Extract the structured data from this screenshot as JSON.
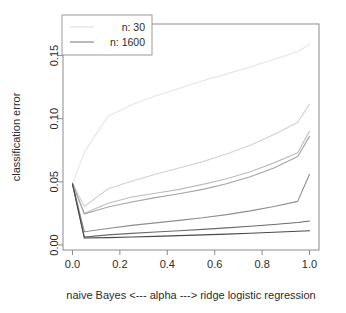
{
  "chart_data": {
    "type": "line",
    "title": "",
    "subtitle": "",
    "xlabel": "naive Bayes  <---  alpha  --->  ridge logistic regression",
    "ylabel": "classification error",
    "xlim": [
      -0.04,
      1.04
    ],
    "ylim": [
      -0.004,
      0.175
    ],
    "xticks": [
      0.0,
      0.2,
      0.4,
      0.6,
      0.8,
      1.0
    ],
    "xtick_labels": [
      "0.0",
      "0.2",
      "0.4",
      "0.6",
      "0.8",
      "1.0"
    ],
    "yticks": [
      0.0,
      0.05,
      0.1,
      0.15
    ],
    "ytick_labels": [
      "0.00",
      "0.05",
      "0.10",
      "0.15"
    ],
    "grid": false,
    "legend_position": "top-left",
    "legend_entries": [
      {
        "label": "n: 30",
        "color": "#e2e2e2"
      },
      {
        "label": "n: 1600",
        "color": "#8a8a8a"
      }
    ],
    "x": [
      0.0,
      0.05,
      0.15,
      0.25,
      0.35,
      0.45,
      0.55,
      0.65,
      0.75,
      0.85,
      0.95,
      1.0
    ],
    "series": [
      {
        "name": "n: 30",
        "color": "#e6e6e6",
        "values": [
          0.048,
          0.0735,
          0.102,
          0.111,
          0.118,
          0.124,
          0.13,
          0.1355,
          0.141,
          0.147,
          0.153,
          0.159
        ]
      },
      {
        "name": "n: 60",
        "color": "#d2d2d2",
        "values": [
          0.049,
          0.0305,
          0.0445,
          0.0505,
          0.056,
          0.061,
          0.066,
          0.072,
          0.079,
          0.0875,
          0.097,
          0.1115
        ]
      },
      {
        "name": "n: 120",
        "color": "#bcbcbc",
        "values": [
          0.0488,
          0.025,
          0.033,
          0.038,
          0.041,
          0.044,
          0.048,
          0.0525,
          0.058,
          0.065,
          0.073,
          0.09
        ]
      },
      {
        "name": "n: 240",
        "color": "#a4a4a4",
        "values": [
          0.0487,
          0.0245,
          0.03,
          0.034,
          0.0375,
          0.0405,
          0.044,
          0.0485,
          0.054,
          0.061,
          0.07,
          0.086
        ]
      },
      {
        "name": "n: 480",
        "color": "#8e8e8e",
        "values": [
          0.0486,
          0.0105,
          0.013,
          0.0155,
          0.0175,
          0.0195,
          0.0215,
          0.024,
          0.027,
          0.0305,
          0.0345,
          0.056
        ]
      },
      {
        "name": "n: 960",
        "color": "#6a6a6a",
        "values": [
          0.0484,
          0.0062,
          0.008,
          0.0092,
          0.0103,
          0.0113,
          0.0123,
          0.0135,
          0.0148,
          0.0162,
          0.0178,
          0.019
        ]
      },
      {
        "name": "n: 1600",
        "color": "#4a4a4a",
        "values": [
          0.0482,
          0.0055,
          0.0058,
          0.0063,
          0.0068,
          0.0074,
          0.008,
          0.0086,
          0.0093,
          0.01,
          0.0108,
          0.0112
        ]
      }
    ]
  },
  "axes": {
    "y_title": "classification error",
    "x_title": "naive Bayes  <---  alpha  --->  ridge logistic regression",
    "y_tick_0": "0.00",
    "y_tick_1": "0.05",
    "y_tick_2": "0.10",
    "y_tick_3": "0.15",
    "x_tick_0": "0.0",
    "x_tick_1": "0.2",
    "x_tick_2": "0.4",
    "x_tick_3": "0.6",
    "x_tick_4": "0.8",
    "x_tick_5": "1.0"
  },
  "legend": {
    "entry_0_label": "n: 30",
    "entry_1_label": "n: 1600"
  }
}
